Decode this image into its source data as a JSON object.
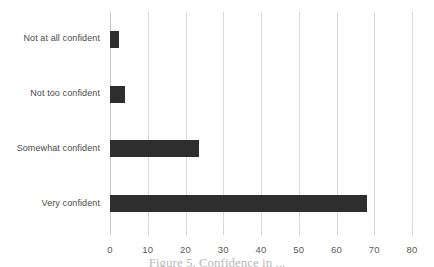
{
  "chart_data": {
    "type": "bar",
    "orientation": "horizontal",
    "title": "",
    "xlabel": "",
    "ylabel": "",
    "categories": [
      "Very confident",
      "Somewhat confident",
      "Not too confident",
      "Not at all confident"
    ],
    "values": [
      68,
      23.5,
      4,
      2.5
    ],
    "series": [
      {
        "name": "Percent of respondents",
        "values": [
          68,
          23.5,
          4,
          2.5
        ]
      }
    ],
    "xlim": [
      0,
      80
    ],
    "xticks": [
      0,
      10,
      20,
      30,
      40,
      50,
      60,
      70,
      80
    ],
    "xtick_labels": [
      "0",
      "10",
      "20",
      "30",
      "40",
      "50",
      "60",
      "70",
      "80"
    ],
    "grid": true,
    "grid_axis": "x",
    "legend": false,
    "legend_position": "none",
    "bar_color": "#2e2e2e",
    "grid_color": "#d9d9d9",
    "background": "#ffffff"
  },
  "caption": {
    "text": "Figure 5. Confidence in ... ",
    "visible": "partially-clipped"
  },
  "colors": {
    "bar": "#2e2e2e",
    "grid": "#d9d9d9",
    "tick_text": "#5a5a5a",
    "category_text": "#4a4a4a",
    "caption_text": "#b9b9b9",
    "background": "#ffffff"
  }
}
